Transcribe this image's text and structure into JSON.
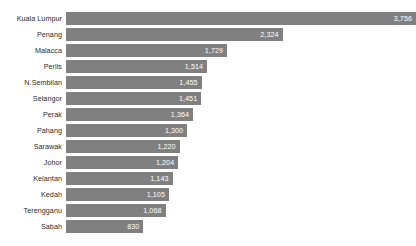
{
  "chart_data": {
    "type": "bar",
    "orientation": "horizontal",
    "title": "",
    "xlabel": "",
    "ylabel": "",
    "grid": false,
    "legend": null,
    "xlim": [
      0,
      3756
    ],
    "axis_visible": false,
    "value_label_position": "inside-end",
    "sort": "descending",
    "colors": {
      "bar": "#808080",
      "value_label": "#ffffff",
      "category_label": "#2b2b2b",
      "background": "#ffffff"
    },
    "categories": [
      "Kuala Lumpur",
      "Penang",
      "Malacca",
      "Perlis",
      "N.Sembilan",
      "Selangor",
      "Perak",
      "Pahang",
      "Sarawak",
      "Johor",
      "Kelantan",
      "Kedah",
      "Terengganu",
      "Sabah"
    ],
    "values": [
      3756,
      2324,
      1729,
      1514,
      1455,
      1451,
      1364,
      1300,
      1220,
      1204,
      1143,
      1105,
      1068,
      830
    ],
    "value_labels": [
      "3,756",
      "2,324",
      "1,729",
      "1,514",
      "1,455",
      "1,451",
      "1,364",
      "1,300",
      "1,220",
      "1,204",
      "1,143",
      "1,105",
      "1,068",
      "830"
    ]
  }
}
